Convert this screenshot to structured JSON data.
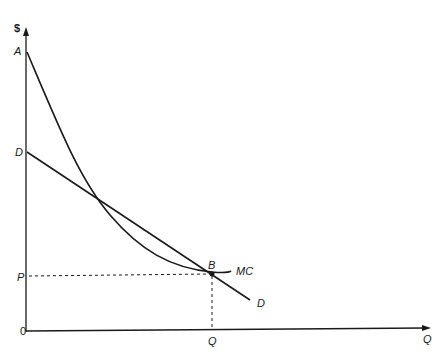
{
  "diagram": {
    "axis_labels": {
      "y": "$",
      "x": "Q",
      "origin": "0"
    },
    "vertical_labels": {
      "A": "A",
      "D": "D",
      "P": "P"
    },
    "horizontal_labels": {
      "Q": "Q"
    },
    "curve_labels": {
      "mc": "MC",
      "demand": "D"
    },
    "point_labels": {
      "B": "B"
    },
    "colors": {
      "line": "#1a1a1a",
      "background": "#ffffff"
    }
  }
}
